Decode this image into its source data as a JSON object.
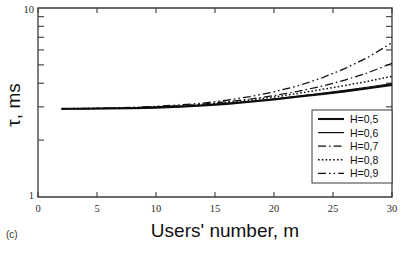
{
  "figure": {
    "panel_label": "(c)",
    "background": "#ffffff",
    "line_color": "#0d0d0d"
  },
  "chart_data": {
    "type": "line",
    "title": "",
    "xlabel": "Users' number, m",
    "ylabel": "τ, ms",
    "xlim": [
      0,
      30
    ],
    "ylim": [
      1,
      10
    ],
    "yscale": "log",
    "xscale": "linear",
    "grid": false,
    "legend_position": "lower-right",
    "xticks": [
      0,
      5,
      10,
      15,
      20,
      25,
      30
    ],
    "xtick_labels": [
      "0",
      "5",
      "10",
      "15",
      "20",
      "25",
      "30"
    ],
    "yticks": [
      1,
      10
    ],
    "ytick_labels": [
      "1",
      "10"
    ],
    "yminor_ticks": [
      2,
      3,
      4,
      5,
      6,
      7,
      8,
      9
    ],
    "x": [
      2,
      4,
      6,
      8,
      10,
      12,
      14,
      16,
      18,
      20,
      22,
      24,
      26,
      28,
      30
    ],
    "series": [
      {
        "name": "H=0,5",
        "label": "H=0,5",
        "style": "solid",
        "width": 2.1,
        "values": [
          2.93,
          2.93,
          2.94,
          2.95,
          2.97,
          3.0,
          3.05,
          3.11,
          3.19,
          3.28,
          3.39,
          3.5,
          3.62,
          3.76,
          3.92
        ]
      },
      {
        "name": "H=0,6",
        "label": "H=0,6",
        "style": "solid",
        "width": 1.2,
        "values": [
          2.93,
          2.93,
          2.94,
          2.95,
          2.98,
          3.01,
          3.06,
          3.13,
          3.21,
          3.31,
          3.42,
          3.54,
          3.67,
          3.82,
          3.98
        ]
      },
      {
        "name": "H=0,7",
        "label": "H=0,7",
        "style": "dashdot",
        "width": 1.2,
        "values": [
          2.93,
          2.94,
          2.95,
          2.97,
          3.0,
          3.04,
          3.1,
          3.19,
          3.3,
          3.44,
          3.62,
          3.85,
          4.15,
          4.55,
          5.1
        ]
      },
      {
        "name": "H=0,8",
        "label": "H=0,8",
        "style": "dotted",
        "width": 1.5,
        "values": [
          2.93,
          2.94,
          2.95,
          2.96,
          2.99,
          3.03,
          3.08,
          3.16,
          3.26,
          3.38,
          3.53,
          3.7,
          3.89,
          4.1,
          4.35
        ]
      },
      {
        "name": "H=0,9",
        "label": "H=0,9",
        "style": "dashdotdot",
        "width": 1.3,
        "values": [
          2.93,
          2.94,
          2.96,
          2.98,
          3.02,
          3.07,
          3.14,
          3.25,
          3.4,
          3.6,
          3.87,
          4.25,
          4.78,
          5.5,
          6.55
        ]
      }
    ]
  }
}
